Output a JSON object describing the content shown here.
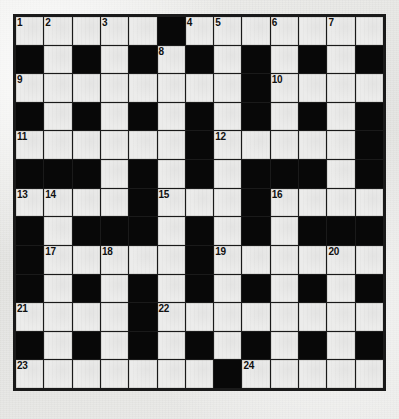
{
  "puzzle": {
    "type": "crossword-grid",
    "title": "Crossword Puzzle Grid",
    "columns": 13,
    "rows": 13,
    "colors": {
      "paper": "#e9e9e7",
      "white_cell": "#ececeb",
      "black_cell": "#080808",
      "grid_line": "#1a1a1a",
      "number_text": "#101010"
    },
    "clue_numbers_visible": [
      1,
      2,
      3,
      4,
      5,
      6,
      7,
      8,
      9,
      10,
      11,
      12,
      13,
      14,
      15,
      16,
      17,
      18,
      19,
      20,
      21,
      22,
      23,
      24
    ],
    "legend": {
      "1": "white open cell",
      "0": "black blocked cell"
    },
    "cells": [
      [
        1,
        1,
        1,
        1,
        1,
        0,
        1,
        1,
        1,
        1,
        1,
        1,
        1
      ],
      [
        0,
        1,
        0,
        1,
        0,
        1,
        0,
        1,
        0,
        1,
        0,
        1,
        0
      ],
      [
        1,
        1,
        1,
        1,
        1,
        1,
        1,
        1,
        0,
        1,
        1,
        1,
        1
      ],
      [
        0,
        1,
        0,
        1,
        0,
        1,
        0,
        1,
        0,
        1,
        0,
        1,
        0
      ],
      [
        1,
        1,
        1,
        1,
        1,
        1,
        0,
        1,
        1,
        1,
        1,
        1,
        0
      ],
      [
        0,
        0,
        0,
        1,
        0,
        1,
        0,
        1,
        0,
        0,
        0,
        1,
        0
      ],
      [
        1,
        1,
        1,
        1,
        0,
        1,
        1,
        1,
        0,
        1,
        1,
        1,
        1
      ],
      [
        0,
        1,
        0,
        0,
        0,
        1,
        0,
        1,
        0,
        1,
        0,
        0,
        0
      ],
      [
        0,
        1,
        1,
        1,
        1,
        1,
        0,
        1,
        1,
        1,
        1,
        1,
        1
      ],
      [
        0,
        1,
        0,
        1,
        0,
        1,
        0,
        1,
        0,
        1,
        0,
        1,
        0
      ],
      [
        1,
        1,
        1,
        1,
        0,
        1,
        1,
        1,
        1,
        1,
        1,
        1,
        1
      ],
      [
        0,
        1,
        0,
        1,
        0,
        1,
        0,
        1,
        0,
        1,
        0,
        1,
        0
      ],
      [
        1,
        1,
        1,
        1,
        1,
        1,
        1,
        0,
        1,
        1,
        1,
        1,
        1
      ]
    ],
    "numbers": [
      {
        "n": "1",
        "row": 0,
        "col": 0
      },
      {
        "n": "2",
        "row": 0,
        "col": 1
      },
      {
        "n": "3",
        "row": 0,
        "col": 3
      },
      {
        "n": "4",
        "row": 0,
        "col": 6
      },
      {
        "n": "5",
        "row": 0,
        "col": 7
      },
      {
        "n": "6",
        "row": 0,
        "col": 9
      },
      {
        "n": "7",
        "row": 0,
        "col": 11
      },
      {
        "n": "8",
        "row": 1,
        "col": 5
      },
      {
        "n": "9",
        "row": 2,
        "col": 0
      },
      {
        "n": "10",
        "row": 2,
        "col": 9
      },
      {
        "n": "11",
        "row": 4,
        "col": 0
      },
      {
        "n": "12",
        "row": 4,
        "col": 7
      },
      {
        "n": "13",
        "row": 6,
        "col": 0
      },
      {
        "n": "14",
        "row": 6,
        "col": 1
      },
      {
        "n": "15",
        "row": 6,
        "col": 5
      },
      {
        "n": "16",
        "row": 6,
        "col": 9
      },
      {
        "n": "17",
        "row": 8,
        "col": 1
      },
      {
        "n": "18",
        "row": 8,
        "col": 3
      },
      {
        "n": "19",
        "row": 8,
        "col": 7
      },
      {
        "n": "20",
        "row": 8,
        "col": 11
      },
      {
        "n": "21",
        "row": 10,
        "col": 0
      },
      {
        "n": "22",
        "row": 10,
        "col": 5
      },
      {
        "n": "23",
        "row": 12,
        "col": 0
      },
      {
        "n": "24",
        "row": 12,
        "col": 8
      }
    ]
  }
}
